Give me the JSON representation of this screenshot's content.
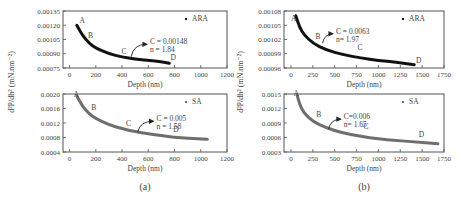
{
  "chart_data": [
    {
      "id": "a-top",
      "panel": "(a)",
      "type": "line",
      "title": "",
      "xlabel": "Depth (nm)",
      "ylabel": "d²P/dh² (mN.nm⁻²)",
      "legend": "ARA",
      "legend_position": "upper right",
      "xlim": [
        -50,
        1200
      ],
      "xticks": [
        0,
        200,
        400,
        600,
        800,
        1000,
        1200
      ],
      "ylim": [
        0.00075,
        0.00135
      ],
      "yticks": [
        "0.00075",
        "0.00090",
        "0.00105",
        "0.00120",
        "0.00135"
      ],
      "grid": false,
      "fit": {
        "C": "0.00148",
        "n": "1.84",
        "label_C": "C = 0.00148",
        "label_n": "n = 1.84"
      },
      "curve": {
        "x_start": 55,
        "x_end": 760,
        "y_start": 0.0012,
        "y_end": 0.0008,
        "color": "#111111",
        "width": 3
      },
      "x": [
        55,
        100,
        150,
        200,
        300,
        400,
        500,
        600,
        700,
        760
      ],
      "y": [
        0.0012,
        0.00109,
        0.00101,
        0.00096,
        0.0009,
        0.000865,
        0.000845,
        0.00083,
        0.000815,
        0.0008
      ],
      "points": [
        {
          "label": "A",
          "x": 75,
          "y": 0.00122
        },
        {
          "label": "B",
          "x": 140,
          "y": 0.00107
        },
        {
          "label": "C",
          "x": 395,
          "y": 0.0009
        },
        {
          "label": "D",
          "x": 770,
          "y": 0.00083
        }
      ],
      "arrow": {
        "from_x": 470,
        "from_y": 0.00087,
        "to_x": 590,
        "to_y": 0.001
      }
    },
    {
      "id": "a-bottom",
      "panel": "(a)",
      "type": "line",
      "xlabel": "Depth (nm)",
      "ylabel": "d²P/dh² (mN.nm⁻²)",
      "legend": "SA",
      "xlim": [
        -50,
        1200
      ],
      "xticks": [
        0,
        200,
        400,
        600,
        800,
        1000,
        1200
      ],
      "ylim": [
        0.0004,
        0.002
      ],
      "yticks": [
        "0.0004",
        "0.0008",
        "0.0012",
        "0.0016",
        "0.0020"
      ],
      "grid": false,
      "fit": {
        "C": "0.005",
        "n": "1.58",
        "label_C": "C = 0.005",
        "label_n": "n = 1.58"
      },
      "curve": {
        "color": "#6e6e6e",
        "width": 3
      },
      "x": [
        55,
        100,
        150,
        200,
        300,
        400,
        500,
        600,
        700,
        800,
        900,
        1050
      ],
      "y": [
        0.00195,
        0.00165,
        0.00145,
        0.00132,
        0.00115,
        0.00104,
        0.00096,
        0.0009,
        0.00085,
        0.00081,
        0.00078,
        0.00075
      ],
      "points": [
        {
          "label": "A",
          "x": 30,
          "y": 0.00193
        },
        {
          "label": "B",
          "x": 165,
          "y": 0.00155
        },
        {
          "label": "C",
          "x": 430,
          "y": 0.00113
        },
        {
          "label": "D",
          "x": 790,
          "y": 0.00095
        }
      ],
      "arrow": {
        "from_x": 520,
        "from_y": 0.00095,
        "to_x": 640,
        "to_y": 0.00125
      }
    },
    {
      "id": "b-top",
      "panel": "(b)",
      "type": "line",
      "xlabel": "Depth (nm)",
      "ylabel": "d²P/dh² (mN.nm⁻²)",
      "legend": "ARA",
      "xlim": [
        -80,
        1750
      ],
      "xticks": [
        0,
        250,
        500,
        750,
        1000,
        1250,
        1500,
        1750
      ],
      "ylim": [
        0.00096,
        0.00108
      ],
      "yticks": [
        "0.00096",
        "0.00099",
        "0.00102",
        "0.00105",
        "0.00108"
      ],
      "grid": false,
      "fit": {
        "C": "0.0063",
        "n": "1.97",
        "label_C": "C = 0.0063",
        "label_n": "n= 1.97"
      },
      "curve": {
        "color": "#111111",
        "width": 3
      },
      "x": [
        55,
        100,
        150,
        250,
        400,
        600,
        800,
        1000,
        1200,
        1410
      ],
      "y": [
        0.00107,
        0.001045,
        0.00103,
        0.001012,
        0.000998,
        0.000988,
        0.000981,
        0.000976,
        0.000972,
        0.000967
      ],
      "points": [
        {
          "label": "A",
          "x": 0,
          "y": 0.001058
        },
        {
          "label": "B",
          "x": 280,
          "y": 0.001021
        },
        {
          "label": "C",
          "x": 760,
          "y": 0.000998
        },
        {
          "label": "D",
          "x": 1430,
          "y": 0.000971
        }
      ],
      "arrow": {
        "from_x": 360,
        "from_y": 0.001012,
        "to_x": 480,
        "to_y": 0.001032
      }
    },
    {
      "id": "b-bottom",
      "panel": "(b)",
      "type": "line",
      "xlabel": "Depth (nm)",
      "ylabel": "d²P/dh² (mN.nm⁻²)",
      "legend": "SA",
      "xlim": [
        -80,
        1750
      ],
      "xticks": [
        0,
        250,
        500,
        750,
        1000,
        1250,
        1500,
        1750
      ],
      "ylim": [
        0.0003,
        0.0015
      ],
      "yticks": [
        "0.0003",
        "0.0006",
        "0.0009",
        "0.0012",
        "0.0015"
      ],
      "grid": false,
      "fit": {
        "C": "0.006",
        "n": "1.65",
        "label_C": "C=0.006",
        "label_n": "n= 1.65"
      },
      "curve": {
        "color": "#6e6e6e",
        "width": 3
      },
      "x": [
        70,
        100,
        150,
        250,
        400,
        600,
        800,
        1000,
        1200,
        1400,
        1680
      ],
      "y": [
        0.00148,
        0.00128,
        0.0011,
        0.00093,
        0.0008,
        0.00069,
        0.00062,
        0.00057,
        0.00054,
        0.00051,
        0.00047
      ],
      "points": [
        {
          "label": "A",
          "x": 30,
          "y": 0.00145
        },
        {
          "label": "B",
          "x": 290,
          "y": 0.00103
        },
        {
          "label": "C",
          "x": 830,
          "y": 0.00077
        },
        {
          "label": "D",
          "x": 1460,
          "y": 0.00061
        }
      ],
      "arrow": {
        "from_x": 430,
        "from_y": 0.00077,
        "to_x": 570,
        "to_y": 0.00098
      }
    }
  ],
  "captions": {
    "a": "(a)",
    "b": "(b)"
  },
  "layout_frames": [
    {
      "l": 63,
      "t": 11,
      "r": 227,
      "b": 68
    },
    {
      "l": 63,
      "t": 94,
      "r": 227,
      "b": 152
    },
    {
      "l": 284,
      "t": 11,
      "r": 444,
      "b": 68
    },
    {
      "l": 284,
      "t": 94,
      "r": 444,
      "b": 152
    }
  ]
}
